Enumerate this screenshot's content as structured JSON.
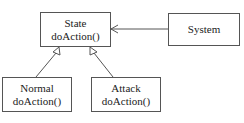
{
  "diagram": {
    "type": "uml-class-diagram",
    "classes": [
      {
        "id": "state",
        "name": "State",
        "method": "doAction()"
      },
      {
        "id": "system",
        "name": "System"
      },
      {
        "id": "normal",
        "name": "Normal",
        "method": "doAction()"
      },
      {
        "id": "attack",
        "name": "Attack",
        "method": "doAction()"
      }
    ],
    "relations": [
      {
        "from": "system",
        "to": "state",
        "kind": "association"
      },
      {
        "from": "normal",
        "to": "state",
        "kind": "inheritance"
      },
      {
        "from": "attack",
        "to": "state",
        "kind": "inheritance"
      }
    ]
  },
  "colors": {
    "line": "#555555",
    "background": "#ffffff",
    "text": "#222222"
  }
}
